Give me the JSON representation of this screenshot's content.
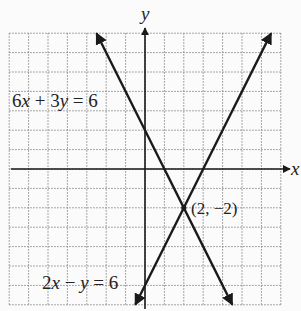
{
  "chart_data": {
    "type": "line",
    "title": "",
    "xlabel": "x",
    "ylabel": "y",
    "xlim": [
      -7,
      7
    ],
    "ylim": [
      -7,
      7
    ],
    "grid": true,
    "grid_style": "dotted",
    "series": [
      {
        "name": "6x + 3y = 6",
        "equation": "y = 2 - 2x",
        "x": [
          -2.5,
          4.5
        ],
        "y": [
          7,
          -7
        ],
        "arrows": "both"
      },
      {
        "name": "2x - y = 6",
        "equation": "y = 2x - 6",
        "x": [
          -0.5,
          6.5
        ],
        "y": [
          -7,
          7
        ],
        "arrows": "both"
      }
    ],
    "annotations": [
      {
        "text": "(2, -2)",
        "x": 2,
        "y": -2,
        "type": "intersection"
      }
    ]
  },
  "labels": {
    "x_axis": "x",
    "y_axis": "y",
    "eq1": {
      "coef1": "6",
      "var1": "x",
      "op": " + ",
      "coef2": "3",
      "var2": "y",
      "rhs": " = 6"
    },
    "eq2": {
      "coef1": "2",
      "var1": "x",
      "op": " − ",
      "var2": "y",
      "rhs": " = 6"
    },
    "point": "(2, −2)"
  },
  "colors": {
    "line": "#1a1a1a",
    "grid": "#8a8a8a",
    "background": "#fbfbfb"
  }
}
